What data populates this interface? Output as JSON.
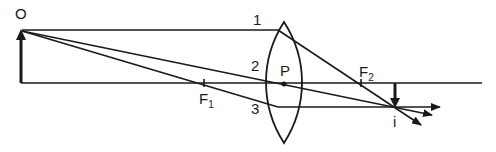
{
  "diagram": {
    "type": "optics-ray-diagram",
    "colors": {
      "ink": "#1a1a1a",
      "background": "#ffffff"
    },
    "labels": {
      "object": "O",
      "ray1": "1",
      "ray2": "2",
      "ray3": "3",
      "optical_center": "P",
      "focus1": "F",
      "focus1_sub": "1",
      "focus2": "F",
      "focus2_sub": "2",
      "image": "i"
    },
    "elements": {
      "principal_axis": {
        "x1": 21,
        "x2": 482,
        "y": 83
      },
      "object_arrow": {
        "x": 21,
        "base_y": 82,
        "tip_y": 30
      },
      "lens": {
        "cx": 284,
        "top_y": 22,
        "bottom_y": 143,
        "half_width": 18
      },
      "optical_center": {
        "x": 284,
        "y": 84
      },
      "focus1": {
        "x": 204,
        "y": 83
      },
      "focus2": {
        "x": 361,
        "y": 83
      },
      "image_arrow": {
        "x": 395,
        "base_y": 83,
        "tip_y": 107
      }
    },
    "rays": [
      {
        "id": "1",
        "description": "parallel to axis, refracts through F2"
      },
      {
        "id": "2",
        "description": "through optical center P, undeviated"
      },
      {
        "id": "3",
        "description": "through F1, emerges parallel to axis"
      }
    ]
  }
}
